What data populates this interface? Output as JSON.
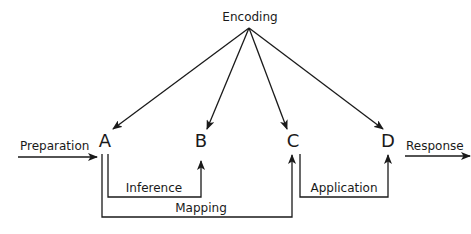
{
  "diagram": {
    "source_label": "Encoding",
    "nodes": [
      {
        "id": "A",
        "label": "A"
      },
      {
        "id": "B",
        "label": "B"
      },
      {
        "id": "C",
        "label": "C"
      },
      {
        "id": "D",
        "label": "D"
      }
    ],
    "input_label": "Preparation",
    "output_label": "Response",
    "connections": {
      "inference": "Inference",
      "mapping": "Mapping",
      "application": "Application"
    },
    "edges": [
      {
        "from": "Encoding",
        "to": "A"
      },
      {
        "from": "Encoding",
        "to": "B"
      },
      {
        "from": "Encoding",
        "to": "C"
      },
      {
        "from": "Encoding",
        "to": "D"
      },
      {
        "from": "Preparation",
        "to": "A"
      },
      {
        "from": "A",
        "to": "B",
        "label": "Inference"
      },
      {
        "from": "A",
        "to": "C",
        "label": "Mapping"
      },
      {
        "from": "C",
        "to": "D",
        "label": "Application"
      },
      {
        "from": "D",
        "to": "Response"
      }
    ],
    "colors": {
      "ink": "#1a1a1a",
      "background": "#ffffff"
    }
  }
}
